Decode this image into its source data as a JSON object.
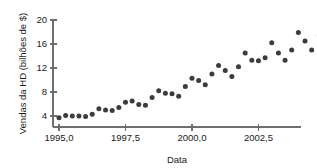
{
  "chart_data": {
    "type": "scatter",
    "title": "",
    "xlabel": "Data",
    "ylabel": "Vendas da HD (bilhões de $)",
    "xlim": [
      1994.7,
      2004.6
    ],
    "ylim": [
      2.6,
      21.2
    ],
    "xticks": [
      1995.0,
      1997.5,
      2000.0,
      2002.5
    ],
    "xticklabels": [
      "1995,0",
      "1997,5",
      "2000,0",
      "2002,5"
    ],
    "yticks": [
      4,
      8,
      12,
      16,
      20
    ],
    "yticklabels": [
      "4",
      "8",
      "12",
      "16",
      "20"
    ],
    "grid": false,
    "legend": false,
    "point_color": "#3c3c3c",
    "axis_color": "#6e6e6e",
    "points": [
      {
        "x": 1995.0,
        "y": 3.7
      },
      {
        "x": 1995.25,
        "y": 4.1
      },
      {
        "x": 1995.5,
        "y": 4.0
      },
      {
        "x": 1995.75,
        "y": 4.0
      },
      {
        "x": 1996.0,
        "y": 3.9
      },
      {
        "x": 1996.25,
        "y": 4.3
      },
      {
        "x": 1996.5,
        "y": 5.2
      },
      {
        "x": 1996.75,
        "y": 5.0
      },
      {
        "x": 1997.0,
        "y": 4.9
      },
      {
        "x": 1997.25,
        "y": 5.4
      },
      {
        "x": 1997.5,
        "y": 6.3
      },
      {
        "x": 1997.75,
        "y": 6.5
      },
      {
        "x": 1998.0,
        "y": 5.9
      },
      {
        "x": 1998.25,
        "y": 5.8
      },
      {
        "x": 1998.5,
        "y": 7.1
      },
      {
        "x": 1998.75,
        "y": 8.2
      },
      {
        "x": 1999.0,
        "y": 7.8
      },
      {
        "x": 1999.25,
        "y": 7.7
      },
      {
        "x": 1999.5,
        "y": 7.3
      },
      {
        "x": 1999.75,
        "y": 8.9
      },
      {
        "x": 2000.0,
        "y": 10.3
      },
      {
        "x": 2000.25,
        "y": 9.9
      },
      {
        "x": 2000.5,
        "y": 9.2
      },
      {
        "x": 2000.75,
        "y": 11.0
      },
      {
        "x": 2001.0,
        "y": 12.4
      },
      {
        "x": 2001.25,
        "y": 11.6
      },
      {
        "x": 2001.5,
        "y": 10.6
      },
      {
        "x": 2001.75,
        "y": 12.2
      },
      {
        "x": 2002.0,
        "y": 14.5
      },
      {
        "x": 2002.25,
        "y": 13.3
      },
      {
        "x": 2002.5,
        "y": 13.2
      },
      {
        "x": 2002.75,
        "y": 13.7
      },
      {
        "x": 2003.0,
        "y": 16.2
      },
      {
        "x": 2003.25,
        "y": 14.5
      },
      {
        "x": 2003.5,
        "y": 13.3
      },
      {
        "x": 2003.75,
        "y": 15.0
      },
      {
        "x": 2004.0,
        "y": 17.9
      },
      {
        "x": 2004.25,
        "y": 16.5
      },
      {
        "x": 2004.5,
        "y": 15.0
      },
      {
        "x": 2004.75,
        "y": 17.5
      },
      {
        "x": 2005.0,
        "y": 20.0
      },
      {
        "x": 2005.25,
        "y": 18.5
      },
      {
        "x": 2005.5,
        "y": 16.8
      }
    ]
  },
  "geometry": {
    "x_origin_px": 59,
    "x_units_per_px": 0.0376,
    "y_base_px": 116,
    "y_units_per_px": 0.1667,
    "axis_left_px": 53,
    "axis_right_px": 301,
    "axis_y_px": 127,
    "axis_top_px": 20
  }
}
